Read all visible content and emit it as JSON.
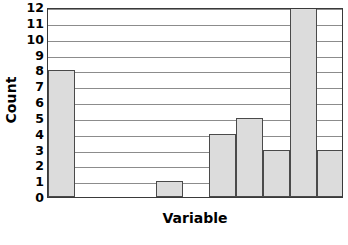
{
  "chart_data": {
    "type": "bar",
    "title": "",
    "subtitle": "",
    "xlabel": "Variable",
    "ylabel": "Count",
    "categories": [
      "1",
      "2",
      "3",
      "4",
      "5",
      "6",
      "7",
      "8",
      "9",
      "10",
      "11"
    ],
    "values": [
      8,
      0,
      0,
      0,
      1,
      0,
      4,
      5,
      3,
      12,
      3
    ],
    "ylim": [
      0,
      12
    ],
    "xlim": [
      0,
      11
    ],
    "y_ticks": [
      0,
      1,
      2,
      3,
      4,
      5,
      6,
      7,
      8,
      9,
      10,
      11,
      12
    ],
    "y_tick_labels": [
      "0",
      "1",
      "2",
      "3",
      "4",
      "5",
      "6",
      "7",
      "8",
      "9",
      "10",
      "11",
      "12"
    ],
    "x_tick_labels": [],
    "grid": "horizontal",
    "legend": "none",
    "bar_fill_color": "#dcdcdc",
    "bar_edge_color": "#4a4a4a",
    "gridline_color": "#8c8c8c",
    "frame_color": "#3a3a3a",
    "background_color": "#ffffff",
    "annotations": []
  },
  "axes": {
    "y_title": "Count",
    "x_title": "Variable"
  }
}
